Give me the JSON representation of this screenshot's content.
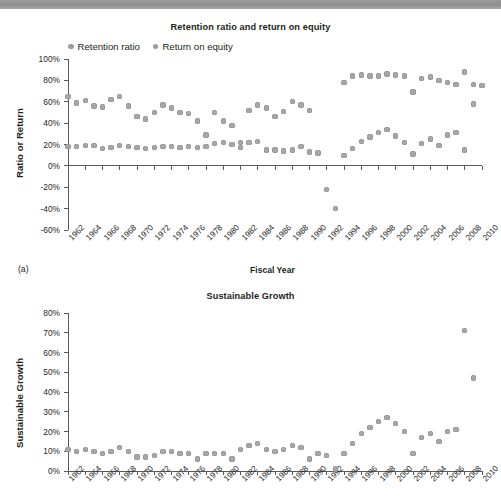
{
  "figure": {
    "panel_tag_a": "(a)"
  },
  "chart_data": [
    {
      "type": "scatter",
      "id": "retention-roe",
      "title": "Retention ratio and return on equity",
      "xlabel": "Fiscal Year",
      "ylabel": "Ratio or Return",
      "ylim": [
        -60,
        100
      ],
      "ytick_values": [
        100,
        80,
        60,
        40,
        20,
        0,
        -20,
        -40,
        -60
      ],
      "ytick_labels": [
        "100%",
        "80%",
        "60%",
        "40%",
        "20%",
        "0%",
        "-20%",
        "-40%",
        "-60%"
      ],
      "xlim": [
        1962,
        2010
      ],
      "xtick_labels": [
        "1962",
        "1964",
        "1966",
        "1968",
        "1970",
        "1972",
        "1974",
        "1976",
        "1978",
        "1980",
        "1982",
        "1984",
        "1986",
        "1988",
        "1990",
        "1992",
        "1994",
        "1996",
        "1998",
        "2000",
        "2002",
        "2004",
        "2006",
        "2008",
        "2010"
      ],
      "grid": false,
      "legend_position": "top-left",
      "x": [
        1962,
        1963,
        1964,
        1965,
        1966,
        1967,
        1968,
        1969,
        1970,
        1971,
        1972,
        1973,
        1974,
        1975,
        1976,
        1977,
        1978,
        1979,
        1980,
        1981,
        1982,
        1983,
        1984,
        1985,
        1986,
        1987,
        1988,
        1989,
        1990,
        1991,
        1992,
        1993,
        1994,
        1995,
        1996,
        1997,
        1998,
        1999,
        2000,
        2001,
        2002,
        2003,
        2004,
        2005,
        2006,
        2007,
        2008,
        2009,
        2010
      ],
      "series": [
        {
          "name": "Retention ratio",
          "color": "#a7a7a9",
          "values": [
            18,
            18,
            19,
            19,
            16,
            17,
            19,
            18,
            17,
            16,
            17,
            18,
            18,
            17,
            18,
            17,
            18,
            21,
            22,
            20,
            17,
            22,
            23,
            15,
            15,
            14,
            15,
            18,
            13,
            12,
            -22,
            -40,
            10,
            16,
            23,
            27,
            31,
            34,
            28,
            22,
            11,
            21,
            25,
            19,
            29,
            31,
            15,
            58,
            null
          ]
        },
        {
          "name": "Return on equity",
          "color": "#a7a7a9",
          "values": [
            65,
            59,
            61,
            56,
            55,
            62,
            65,
            56,
            46,
            44,
            50,
            57,
            54,
            50,
            49,
            42,
            29,
            50,
            42,
            38,
            22,
            52,
            57,
            54,
            46,
            51,
            60,
            57,
            52,
            null,
            null,
            null,
            78,
            84,
            85,
            84,
            84,
            86,
            85,
            84,
            69,
            82,
            83,
            80,
            78,
            76,
            88,
            76,
            75
          ]
        }
      ]
    },
    {
      "type": "scatter",
      "id": "sustainable-growth",
      "title": "Sustainable Growth",
      "xlabel": "",
      "ylabel": "Sustainable Growth",
      "ylim": [
        0,
        80
      ],
      "ytick_values": [
        80,
        70,
        60,
        50,
        40,
        30,
        20,
        10,
        0
      ],
      "ytick_labels": [
        "80%",
        "70%",
        "60%",
        "50%",
        "40%",
        "30%",
        "20%",
        "10%",
        "0%"
      ],
      "xlim": [
        1962,
        2010
      ],
      "xtick_labels": [
        "1962",
        "1964",
        "1966",
        "1968",
        "1970",
        "1972",
        "1974",
        "1976",
        "1978",
        "1980",
        "1982",
        "1984",
        "1986",
        "1988",
        "1990",
        "1992",
        "1994",
        "1996",
        "1998",
        "2000",
        "2002",
        "2004",
        "2006",
        "2008",
        "2010"
      ],
      "grid": false,
      "x": [
        1962,
        1963,
        1964,
        1965,
        1966,
        1967,
        1968,
        1969,
        1970,
        1971,
        1972,
        1973,
        1974,
        1975,
        1976,
        1977,
        1978,
        1979,
        1980,
        1981,
        1982,
        1983,
        1984,
        1985,
        1986,
        1987,
        1988,
        1989,
        1990,
        1991,
        1992,
        1993,
        1994,
        1995,
        1996,
        1997,
        1998,
        1999,
        2000,
        2001,
        2002,
        2003,
        2004,
        2005,
        2006,
        2007,
        2008,
        2009
      ],
      "series": [
        {
          "name": "Sustainable growth",
          "color": "#a7a7a9",
          "values": [
            11,
            10,
            11,
            10,
            9,
            10,
            12,
            10,
            7,
            7,
            8,
            10,
            10,
            9,
            9,
            6,
            9,
            9,
            9,
            6,
            11,
            13,
            14,
            11,
            10,
            11,
            13,
            12,
            6,
            9,
            8,
            1,
            9,
            14,
            19,
            22,
            25,
            27,
            24,
            20,
            9,
            17,
            19,
            15,
            20,
            21,
            71,
            47
          ]
        }
      ]
    }
  ]
}
